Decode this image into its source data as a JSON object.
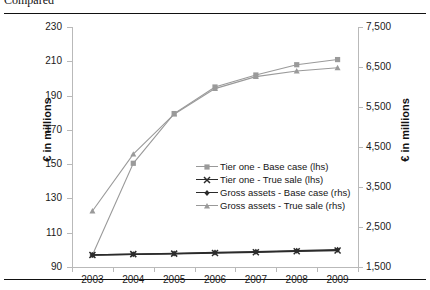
{
  "caption": "Compared",
  "axes": {
    "left_title": "€ in millions",
    "right_title": "€ in millions",
    "left_ticks": [
      "230",
      "210",
      "190",
      "170",
      "150",
      "130",
      "110",
      "90"
    ],
    "right_ticks": [
      "7,500",
      "6,500",
      "5,500",
      "4,500",
      "3,500",
      "2,500",
      "1,500"
    ],
    "x_ticks": [
      "2003",
      "2004",
      "2005",
      "2006",
      "2007",
      "2008",
      "2009"
    ]
  },
  "legend": {
    "items": [
      {
        "label": "Tier one - Base case (lhs)",
        "marker": "square",
        "color": "#9a9a9a"
      },
      {
        "label": "Tier one - True sale (lhs)",
        "marker": "cross",
        "color": "#2b2b2b"
      },
      {
        "label": "Gross assets - Base case (rhs)",
        "marker": "diamond",
        "color": "#2b2b2b"
      },
      {
        "label": "Gross assets - True sale (rhs)",
        "marker": "triangle",
        "color": "#9a9a9a"
      }
    ]
  },
  "chart_data": {
    "type": "line",
    "title": "",
    "xlabel": "",
    "ylabel": "€ in millions",
    "y2label": "€ in millions",
    "categories": [
      "2003",
      "2004",
      "2005",
      "2006",
      "2007",
      "2008",
      "2009"
    ],
    "ylim": [
      90,
      230
    ],
    "y2lim": [
      1500,
      7500
    ],
    "yticks": [
      90,
      110,
      130,
      150,
      170,
      190,
      210,
      230
    ],
    "y2ticks": [
      1500,
      2500,
      3500,
      4500,
      5500,
      6500,
      7500
    ],
    "grid": false,
    "legend_position": "inside-center-right",
    "series": [
      {
        "name": "Tier one - Base case (lhs)",
        "axis": "left",
        "marker": "square",
        "color": "#9a9a9a",
        "values": [
          97,
          150.5,
          179.5,
          195,
          202,
          208,
          211
        ]
      },
      {
        "name": "Tier one - True sale (lhs)",
        "axis": "left",
        "marker": "cross",
        "color": "#2b2b2b",
        "values": [
          97,
          97.5,
          97.8,
          98.2,
          98.6,
          99.2,
          99.6
        ]
      },
      {
        "name": "Gross assets - Base case (rhs)",
        "axis": "right",
        "marker": "diamond",
        "color": "#2b2b2b",
        "values": [
          1800,
          1820,
          1840,
          1860,
          1880,
          1905,
          1930
        ]
      },
      {
        "name": "Gross assets - True sale (rhs)",
        "axis": "right",
        "marker": "triangle",
        "color": "#9a9a9a",
        "values": [
          2900,
          4320,
          5320,
          5960,
          6260,
          6400,
          6480
        ]
      }
    ]
  }
}
